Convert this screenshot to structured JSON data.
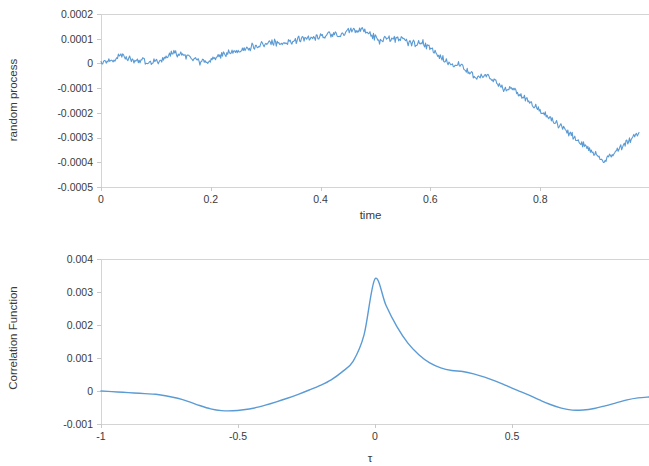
{
  "figure": {
    "background_color": "#ffffff",
    "line_color": "#5b9bd5",
    "axis_color": "#d4d4d4",
    "text_color": "#3a3a3a"
  },
  "chart_data": [
    {
      "id": "random-process",
      "type": "line",
      "title": "",
      "xlabel": "time",
      "ylabel": "random process",
      "xlim": [
        0,
        1
      ],
      "ylim": [
        -0.0005,
        0.0002
      ],
      "xticks": [
        0,
        0.2,
        0.4,
        0.6,
        0.8
      ],
      "xticklabels": [
        "0",
        "0.2",
        "0.4",
        "0.6",
        "0.8"
      ],
      "yticks": [
        0.0002,
        0.0001,
        0,
        -0.0001,
        -0.0002,
        -0.0003,
        -0.0004,
        -0.0005
      ],
      "yticklabels": [
        "0.0002",
        "0.0001",
        "0",
        "-0.0001",
        "-0.0002",
        "-0.0003",
        "-0.0004",
        "-0.0005"
      ],
      "grid": false,
      "legend": null,
      "series": [
        {
          "name": "random process",
          "color": "#5b9bd5",
          "x": [
            0.0,
            0.004,
            0.008,
            0.012,
            0.016,
            0.02,
            0.024,
            0.028,
            0.032,
            0.036,
            0.04,
            0.044,
            0.048,
            0.052,
            0.056,
            0.06,
            0.064,
            0.068,
            0.072,
            0.076,
            0.08,
            0.084,
            0.088,
            0.092,
            0.096,
            0.1,
            0.104,
            0.108,
            0.112,
            0.116,
            0.12,
            0.124,
            0.128,
            0.132,
            0.136,
            0.14,
            0.144,
            0.148,
            0.152,
            0.156,
            0.16,
            0.164,
            0.168,
            0.172,
            0.176,
            0.18,
            0.184,
            0.188,
            0.192,
            0.196,
            0.2,
            0.204,
            0.208,
            0.212,
            0.216,
            0.22,
            0.224,
            0.228,
            0.232,
            0.236,
            0.24,
            0.244,
            0.248,
            0.252,
            0.256,
            0.26,
            0.264,
            0.268,
            0.272,
            0.276,
            0.28,
            0.284,
            0.288,
            0.292,
            0.296,
            0.3,
            0.304,
            0.308,
            0.312,
            0.316,
            0.32,
            0.324,
            0.328,
            0.332,
            0.336,
            0.34,
            0.344,
            0.348,
            0.352,
            0.356,
            0.36,
            0.364,
            0.368,
            0.372,
            0.376,
            0.38,
            0.384,
            0.388,
            0.392,
            0.396,
            0.4,
            0.404,
            0.408,
            0.412,
            0.416,
            0.42,
            0.424,
            0.428,
            0.432,
            0.436,
            0.44,
            0.444,
            0.448,
            0.452,
            0.456,
            0.46,
            0.464,
            0.468,
            0.472,
            0.476,
            0.48,
            0.484,
            0.488,
            0.492,
            0.496,
            0.5,
            0.504,
            0.508,
            0.512,
            0.516,
            0.52,
            0.524,
            0.528,
            0.532,
            0.536,
            0.54,
            0.544,
            0.548,
            0.552,
            0.556,
            0.56,
            0.564,
            0.568,
            0.572,
            0.576,
            0.58,
            0.584,
            0.588,
            0.592,
            0.596,
            0.6,
            0.604,
            0.608,
            0.612,
            0.616,
            0.62,
            0.624,
            0.628,
            0.632,
            0.636,
            0.64,
            0.644,
            0.648,
            0.652,
            0.656,
            0.66,
            0.664,
            0.668,
            0.672,
            0.676,
            0.68,
            0.684,
            0.688,
            0.692,
            0.696,
            0.7,
            0.704,
            0.708,
            0.712,
            0.716,
            0.72,
            0.724,
            0.728,
            0.732,
            0.736,
            0.74,
            0.744,
            0.748,
            0.752,
            0.756,
            0.76,
            0.764,
            0.768,
            0.772,
            0.776,
            0.78,
            0.784,
            0.788,
            0.792,
            0.796,
            0.8,
            0.804,
            0.808,
            0.812,
            0.816,
            0.82,
            0.824,
            0.828,
            0.832,
            0.836,
            0.84,
            0.844,
            0.848,
            0.852,
            0.856,
            0.86,
            0.864,
            0.868,
            0.872,
            0.876,
            0.88,
            0.884,
            0.888,
            0.892,
            0.896,
            0.9,
            0.904,
            0.908,
            0.912,
            0.916,
            0.92,
            0.924,
            0.928,
            0.932,
            0.936,
            0.94,
            0.944,
            0.948,
            0.952,
            0.956,
            0.96,
            0.964,
            0.968,
            0.972,
            0.976,
            0.98
          ],
          "y": [
            0.0,
            9e-06,
            4e-06,
            1.4e-05,
            6e-06,
            1.8e-05,
            1.2e-05,
            2.6e-05,
            3.4e-05,
            2.8e-05,
            4e-05,
            3e-05,
            2e-05,
            2.6e-05,
            1.5e-05,
            8e-06,
            1.8e-05,
            1e-05,
            5e-06,
            1.3e-05,
            4e-06,
            -2e-06,
            8e-06,
            1e-06,
            9e-06,
            2e-06,
            1.1e-05,
            4e-06,
            1.4e-05,
            2.3e-05,
            1.6e-05,
            3e-05,
            4e-05,
            4.8e-05,
            3.8e-05,
            3e-05,
            4e-05,
            3.2e-05,
            2.4e-05,
            3.2e-05,
            2.4e-05,
            1.6e-05,
            1e-05,
            1.8e-05,
            1.2e-05,
            4e-06,
            1.3e-05,
            6e-06,
            -1e-06,
            8e-06,
            1.7e-05,
            2.6e-05,
            2e-05,
            3e-05,
            3.8e-05,
            3e-05,
            4e-05,
            3.4e-05,
            4.4e-05,
            3.8e-05,
            4.8e-05,
            4.2e-05,
            5.2e-05,
            4.6e-05,
            5.6e-05,
            6.5e-05,
            5.8e-05,
            6.8e-05,
            6.2e-05,
            7.2e-05,
            6.6e-05,
            7.6e-05,
            7e-05,
            8e-05,
            7.4e-05,
            8.3e-05,
            7.7e-05,
            8.6e-05,
            8e-05,
            8.9e-05,
            8.3e-05,
            9.2e-05,
            8.6e-05,
            8e-05,
            8.9e-05,
            8.3e-05,
            9.3e-05,
            8.7e-05,
            9.6e-05,
            9e-05,
            9.9e-05,
            9.3e-05,
            0.000102,
            9.6e-05,
            0.000105,
            9.9e-05,
            0.000108,
            0.000102,
            0.00011,
            0.000104,
            0.000113,
            0.000106,
            0.000116,
            0.000109,
            0.00012,
            0.000113,
            0.000124,
            0.000117,
            0.00011,
            0.000104,
            0.000113,
            0.000121,
            0.00013,
            0.000138,
            0.000131,
            0.00014,
            0.000133,
            0.000126,
            0.000135,
            0.000143,
            0.000136,
            0.000129,
            0.000122,
            0.000115,
            0.000108,
            0.000101,
            9.3e-05,
            8.6e-05,
            9.3e-05,
            0.000101,
            9.4e-05,
            0.000102,
            9.5e-05,
            0.000103,
            9.6e-05,
            0.000104,
            9.7e-05,
            0.000105,
            9.8e-05,
            9.1e-05,
            8.4e-05,
            7.7e-05,
            8.5e-05,
            7.8e-05,
            8.6e-05,
            7.9e-05,
            8.7e-05,
            8e-05,
            7.3e-05,
            6.6e-05,
            5.9e-05,
            5.2e-05,
            4.5e-05,
            3.8e-05,
            3.1e-05,
            2.4e-05,
            1.7e-05,
            1e-05,
            3e-06,
            -4e-06,
            -1.1e-05,
            -1.8e-05,
            -1e-05,
            -3e-06,
            -1e-05,
            -1.8e-05,
            -2.5e-05,
            -3.2e-05,
            -3.9e-05,
            -4.6e-05,
            -5.3e-05,
            -6e-05,
            -5.2e-05,
            -4.5e-05,
            -5.2e-05,
            -4.4e-05,
            -5.1e-05,
            -5.8e-05,
            -6.5e-05,
            -7.2e-05,
            -7.9e-05,
            -8.6e-05,
            -9.3e-05,
            -0.0001,
            -0.000107,
            -0.000114,
            -0.000106,
            -9.9e-05,
            -0.000106,
            -0.000113,
            -0.00012,
            -0.000127,
            -0.000134,
            -0.000141,
            -0.000148,
            -0.000155,
            -0.000162,
            -0.000169,
            -0.000176,
            -0.000183,
            -0.00019,
            -0.000197,
            -0.000204,
            -0.000211,
            -0.000218,
            -0.000225,
            -0.000232,
            -0.000239,
            -0.000246,
            -0.000253,
            -0.00026,
            -0.000267,
            -0.000274,
            -0.000281,
            -0.000288,
            -0.000295,
            -0.000302,
            -0.000309,
            -0.000316,
            -0.000323,
            -0.00033,
            -0.000337,
            -0.000344,
            -0.000351,
            -0.000358,
            -0.000365,
            -0.000372,
            -0.000379,
            -0.000386,
            -0.000393,
            -0.000385,
            -0.000378,
            -0.000371,
            -0.000364,
            -0.000357,
            -0.00035,
            -0.000343,
            -0.000336,
            -0.000329,
            -0.000322,
            -0.000315,
            -0.000308,
            -0.000301,
            -0.000294,
            -0.000287,
            -0.00028,
            -0.000273,
            -0.00029,
            -0.00031,
            -0.00033,
            -0.00035
          ]
        }
      ]
    },
    {
      "id": "correlation-function",
      "type": "line",
      "title": "",
      "xlabel": "τ",
      "ylabel": "Correlation Function",
      "xlim": [
        -1,
        1
      ],
      "ylim": [
        -0.001,
        0.004
      ],
      "xticks": [
        -1,
        -0.5,
        0,
        0.5
      ],
      "xticklabels": [
        "-1",
        "-0.5",
        "0",
        "0.5"
      ],
      "yticks": [
        0.004,
        0.003,
        0.002,
        0.001,
        0,
        -0.001
      ],
      "yticklabels": [
        "0.004",
        "0.003",
        "0.002",
        "0.001",
        "0",
        "-0.001"
      ],
      "grid": false,
      "legend": null,
      "peak": {
        "x": 0,
        "y": 0.0034
      },
      "minima": [
        {
          "x": -0.66,
          "y": -0.0006
        },
        {
          "x": 0.66,
          "y": -0.00058
        }
      ],
      "series": [
        {
          "name": "Correlation Function",
          "color": "#5b9bd5",
          "x": [
            -1.0,
            -0.96,
            -0.92,
            -0.88,
            -0.84,
            -0.8,
            -0.76,
            -0.72,
            -0.68,
            -0.64,
            -0.6,
            -0.56,
            -0.52,
            -0.48,
            -0.44,
            -0.4,
            -0.36,
            -0.32,
            -0.28,
            -0.24,
            -0.2,
            -0.16,
            -0.12,
            -0.08,
            -0.04,
            0.0,
            0.04,
            0.08,
            0.12,
            0.16,
            0.2,
            0.24,
            0.28,
            0.32,
            0.36,
            0.4,
            0.44,
            0.48,
            0.52,
            0.56,
            0.6,
            0.64,
            0.68,
            0.72,
            0.76,
            0.8,
            0.84,
            0.88,
            0.92,
            0.96,
            1.0
          ],
          "y": [
            0.0,
            -2e-05,
            -4e-05,
            -6e-05,
            -8e-05,
            -0.0001,
            -0.00015,
            -0.00022,
            -0.00032,
            -0.00044,
            -0.00054,
            -0.000595,
            -0.0006,
            -0.00057,
            -0.000515,
            -0.00043,
            -0.00033,
            -0.00022,
            -0.0001,
            3e-05,
            0.00017,
            0.00034,
            0.00058,
            0.0009,
            0.0017,
            0.0034,
            0.0026,
            0.00195,
            0.00145,
            0.0011,
            0.00085,
            0.0007,
            0.00062,
            0.00059,
            0.00052,
            0.00042,
            0.0003,
            0.00016,
            2e-05,
            -0.00012,
            -0.00027,
            -0.00041,
            -0.00052,
            -0.00058,
            -0.000575,
            -0.00053,
            -0.00045,
            -0.00036,
            -0.00027,
            -0.00021,
            -0.00018
          ]
        }
      ]
    }
  ]
}
